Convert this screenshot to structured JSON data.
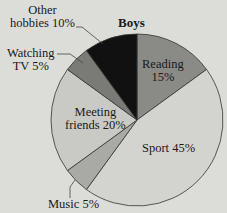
{
  "chart_data": {
    "type": "pie",
    "title": "Boys",
    "categories": [
      "Reading",
      "Sport",
      "Music",
      "Meeting friends",
      "Watching TV",
      "Other hobbies"
    ],
    "values": [
      15,
      45,
      5,
      20,
      5,
      10
    ],
    "unit": "%",
    "start_angle": "12 o'clock",
    "direction": "clockwise",
    "colors": [
      "#8a8a87",
      "#d3d3cf",
      "#a9a9a6",
      "#c9c9c5",
      "#7a7a77",
      "#111111"
    ],
    "labels": {
      "reading": [
        "Reading",
        "15%"
      ],
      "sport": [
        "Sport 45%"
      ],
      "music": [
        "Music 5%"
      ],
      "meeting": [
        "Meeting",
        "friends 20%"
      ],
      "tv": [
        "Watching",
        "TV 5%"
      ],
      "other": [
        "Other",
        "hobbies 10%"
      ]
    }
  }
}
